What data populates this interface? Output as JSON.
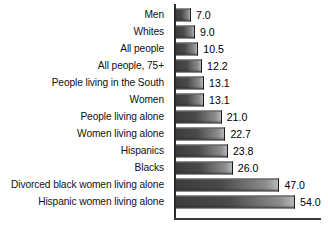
{
  "chart_data": {
    "type": "bar",
    "orientation": "horizontal",
    "title": "",
    "subtitle": "",
    "xlabel": "",
    "ylabel": "",
    "grid": false,
    "legend": null,
    "xlim": [
      0,
      54
    ],
    "axis": {
      "value_axis_max": 54.0,
      "value_axis_visible_baseline": true,
      "category_axis_line": true
    },
    "categories": [
      "Men",
      "Whites",
      "All people",
      "All people, 75+",
      "People living in the South",
      "Women",
      "People living alone",
      "Women living alone",
      "Hispanics",
      "Blacks",
      "Divorced black women living alone",
      "Hispanic women living alone"
    ],
    "values": [
      7.0,
      9.0,
      10.5,
      12.2,
      13.1,
      13.1,
      21.0,
      22.7,
      23.8,
      26.0,
      47.0,
      54.0
    ],
    "value_labels": [
      "7.0",
      "9.0",
      "10.5",
      "12.2",
      "13.1",
      "13.1",
      "21.0",
      "22.7",
      "23.8",
      "26.0",
      "47.0",
      "54.0"
    ]
  },
  "colors": {
    "background": "#ffffff",
    "bar_dark": "#3c3c3c",
    "bar_light": "#b8b8b8",
    "bar_border": "#1a1a1a",
    "axis": "#2b2b2b",
    "text": "#111111"
  },
  "caption": {
    "text": ""
  }
}
